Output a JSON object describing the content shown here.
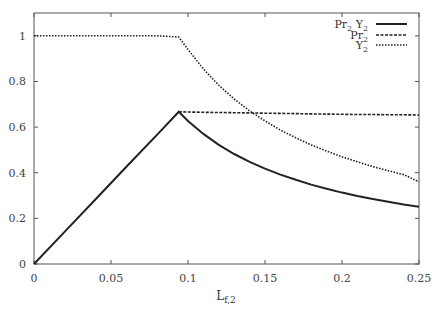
{
  "chart_data": {
    "type": "line",
    "title": "",
    "xlabel": "L",
    "xlabel_sub": "f,2",
    "ylabel": "",
    "xlim": [
      0,
      0.25
    ],
    "ylim": [
      0,
      1.1
    ],
    "grid": false,
    "legend_position": "top-right",
    "x_ticks": [
      0,
      0.05,
      0.1,
      0.15,
      0.2,
      0.25
    ],
    "x_tick_labels": [
      "0",
      "0.05",
      "0.1",
      "0.15",
      "0.2",
      "0.25"
    ],
    "y_ticks": [
      0,
      0.2,
      0.4,
      0.6,
      0.8,
      1
    ],
    "y_tick_labels": [
      "0",
      "0.2",
      "0.4",
      "0.6",
      "0.8",
      "1"
    ],
    "x": [
      0,
      0.02,
      0.04,
      0.06,
      0.08,
      0.094,
      0.1,
      0.11,
      0.12,
      0.13,
      0.14,
      0.15,
      0.16,
      0.17,
      0.18,
      0.19,
      0.2,
      0.21,
      0.22,
      0.23,
      0.24,
      0.25
    ],
    "series": [
      {
        "name": "Pr2 Y2",
        "label_main": "Pr",
        "label_sub": "2",
        "label_main2": " Y",
        "label_sub2": "2",
        "style": "solid",
        "values": [
          0,
          0.142,
          0.284,
          0.426,
          0.567,
          0.667,
          0.627,
          0.57,
          0.522,
          0.482,
          0.448,
          0.418,
          0.392,
          0.369,
          0.348,
          0.33,
          0.313,
          0.298,
          0.285,
          0.273,
          0.261,
          0.251
        ]
      },
      {
        "name": "Pr2",
        "label_main": "Pr",
        "label_sub": "2",
        "style": "dashed",
        "values": [
          null,
          null,
          null,
          null,
          null,
          0.667,
          0.666,
          0.665,
          0.664,
          0.663,
          0.662,
          0.661,
          0.66,
          0.659,
          0.658,
          0.657,
          0.656,
          0.655,
          0.655,
          0.654,
          0.654,
          0.653
        ]
      },
      {
        "name": "Y2",
        "label_main": "Y",
        "label_sub": "2",
        "style": "dotted",
        "values": [
          1,
          1,
          1,
          1,
          1,
          0.995,
          0.94,
          0.855,
          0.783,
          0.723,
          0.671,
          0.627,
          0.587,
          0.553,
          0.522,
          0.495,
          0.47,
          0.448,
          0.427,
          0.409,
          0.392,
          0.36
        ]
      }
    ]
  },
  "colors": {
    "axis": "#555555",
    "line": "#222222"
  }
}
